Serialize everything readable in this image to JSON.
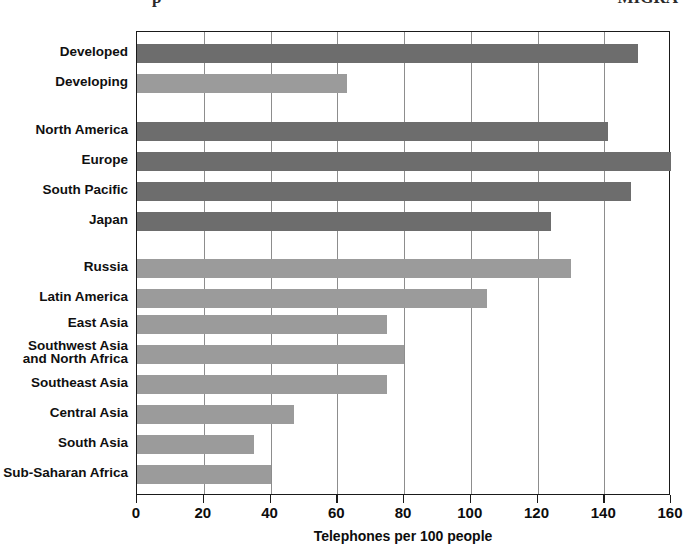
{
  "page_fragments": {
    "left": "p",
    "right": "MIGRA"
  },
  "chart_data": {
    "type": "bar",
    "orientation": "horizontal",
    "title": "",
    "xlabel": "Telephones per 100 people",
    "ylabel": "",
    "xlim": [
      0,
      160
    ],
    "xticks": [
      0,
      20,
      40,
      60,
      80,
      100,
      120,
      140,
      160
    ],
    "grid": true,
    "legend": "none",
    "colors": {
      "dark": "#6d6d6d",
      "light": "#9b9b9b",
      "axis": "#1a1a1a",
      "gridline": "#8d8d8d",
      "text": "#101010"
    },
    "categories": [
      "Developed",
      "Developing",
      "North America",
      "Europe",
      "South Pacific",
      "Japan",
      "Russia",
      "Latin America",
      "East Asia",
      "Southwest Asia\nand North Africa",
      "Southeast Asia",
      "Central Asia",
      "South Asia",
      "Sub-Saharan Africa"
    ],
    "values": [
      150,
      63,
      141,
      160,
      148,
      124,
      130,
      105,
      75,
      80,
      75,
      47,
      35,
      40
    ],
    "shades": [
      "dark",
      "light",
      "dark",
      "dark",
      "dark",
      "dark",
      "light",
      "light",
      "light",
      "light",
      "light",
      "light",
      "light",
      "light"
    ],
    "groups": [
      {
        "name": "global",
        "categories": [
          "Developed",
          "Developing"
        ]
      },
      {
        "name": "more-developed-regions",
        "categories": [
          "North America",
          "Europe",
          "South Pacific",
          "Japan"
        ]
      },
      {
        "name": "less-developed-regions",
        "categories": [
          "Russia",
          "Latin America",
          "East Asia",
          "Southwest Asia and North Africa",
          "Southeast Asia",
          "Central Asia",
          "South Asia",
          "Sub-Saharan Africa"
        ]
      }
    ]
  }
}
